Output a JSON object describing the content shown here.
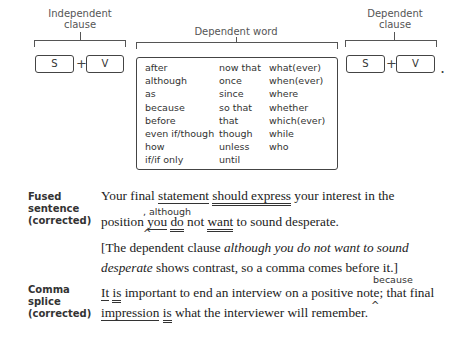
{
  "diagram": {
    "independent_clause": {
      "label_line1": "Independent",
      "label_line2": "clause",
      "subject": "S",
      "plus": "+",
      "verb": "V"
    },
    "dependent_word": {
      "label": "Dependent word",
      "columns": [
        [
          "after",
          "although",
          "as",
          "because",
          "before",
          "even if/though",
          "how",
          "if/if only"
        ],
        [
          "now that",
          "once",
          "since",
          "so that",
          "that",
          "though",
          "unless",
          "until"
        ],
        [
          "what(ever)",
          "when(ever)",
          "where",
          "whether",
          "which(ever)",
          "while",
          "who"
        ]
      ]
    },
    "dependent_clause": {
      "label_line1": "Dependent",
      "label_line2": "clause",
      "subject": "S",
      "plus": "+",
      "verb": "V",
      "period": "."
    }
  },
  "examples": [
    {
      "label_line1": "Fused",
      "label_line2": "sentence",
      "label_line3": "(corrected)",
      "line1": {
        "w1": "Your final ",
        "subject": "statement",
        "sp1": " ",
        "verb": "should express",
        "rest": " your interest in the"
      },
      "insertion": ", although",
      "caret": "^",
      "line2": {
        "w1": "position ",
        "subject": "you",
        "sp1": " ",
        "verb1": "do",
        "mid": " not ",
        "verb2": "want",
        "rest": " to sound desperate."
      },
      "note_line1_a": "[The dependent clause ",
      "note_line1_italic": "although you do not want to sound",
      "note_line2_italic": "desperate",
      "note_line2_rest": " shows contrast, so a comma comes before it.]"
    },
    {
      "label_line1": "Comma",
      "label_line2": "splice",
      "label_line3": "(corrected)",
      "line1": {
        "subject": "It",
        "sp1": " ",
        "verb": "is",
        "rest": " important to end an interview on a positive note",
        "strike": ";",
        "rest2": " that final"
      },
      "insertion": "because",
      "caret": "^",
      "line2": {
        "subject": "impression",
        "sp1": " ",
        "verb": "is",
        "rest": " what the interviewer will remember."
      }
    }
  ]
}
